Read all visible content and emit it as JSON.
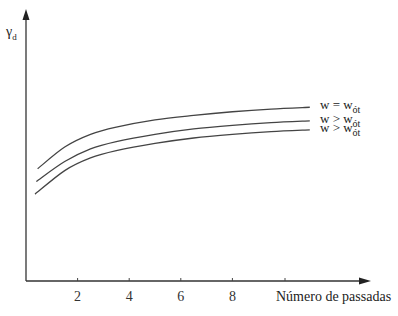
{
  "chart_data": {
    "type": "line",
    "title": "",
    "xlabel": "Número de passadas",
    "ylabel": "γd",
    "ylabel_main": "γ",
    "ylabel_sub": "d",
    "x_ticks": [
      "2",
      "4",
      "6",
      "8"
    ],
    "x_tick_values": [
      2,
      4,
      6,
      8
    ],
    "xlim": [
      0,
      13.5
    ],
    "grid": false,
    "legend_position": "right-end-of-lines",
    "series": [
      {
        "name": "w = wót",
        "label_main": "w = w",
        "label_sub": "ót",
        "x": [
          0.45,
          1.5,
          2.5,
          3.5,
          5,
          6.5,
          8,
          9.5,
          11.0
        ],
        "y": [
          0.62,
          0.74,
          0.81,
          0.85,
          0.89,
          0.915,
          0.935,
          0.95,
          0.96
        ]
      },
      {
        "name": "w > wót",
        "label_main": "w > w",
        "label_sub": "ót",
        "x": [
          0.4,
          1.5,
          2.5,
          3.5,
          5,
          6.5,
          8,
          9.5,
          11.0
        ],
        "y": [
          0.55,
          0.66,
          0.73,
          0.77,
          0.81,
          0.84,
          0.86,
          0.875,
          0.885
        ]
      },
      {
        "name": "w > wót",
        "label_main": "w > w",
        "label_sub": "ót",
        "x": [
          0.35,
          1.5,
          2.5,
          3.5,
          5,
          6.5,
          8,
          9.5,
          11.0
        ],
        "y": [
          0.48,
          0.61,
          0.68,
          0.72,
          0.76,
          0.79,
          0.81,
          0.825,
          0.835
        ]
      }
    ]
  }
}
